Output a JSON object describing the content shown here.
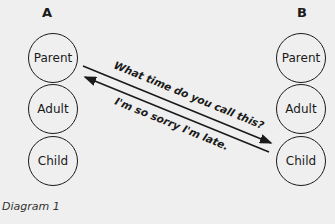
{
  "diagram": {
    "caption": "Diagram 1",
    "column_a": {
      "label": "A",
      "states": [
        "Parent",
        "Adult",
        "Child"
      ]
    },
    "column_b": {
      "label": "B",
      "states": [
        "Parent",
        "Adult",
        "Child"
      ]
    },
    "messages": [
      {
        "text": "What time do you call this?",
        "from": "A.Parent",
        "to": "B.Child"
      },
      {
        "text": "I'm so sorry I'm late.",
        "from": "B.Child",
        "to": "A.Parent"
      }
    ]
  }
}
